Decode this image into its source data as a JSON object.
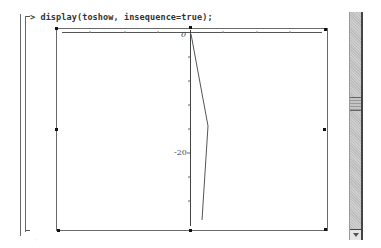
{
  "worksheet": {
    "prompt_symbol": ">",
    "command": "display(toshow, insequence=true);"
  },
  "plot": {
    "y_tick_labels": [
      {
        "label": "0",
        "value": 0
      },
      {
        "label": "-20",
        "value": -20
      }
    ],
    "line_color": "#444444",
    "axis_color": "#333333"
  },
  "scrollbar": {
    "thumb_position_pct": 38,
    "down_arrow": "arrow-down-icon"
  }
}
